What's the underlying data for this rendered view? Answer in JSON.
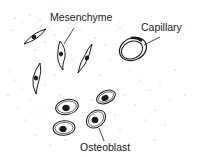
{
  "diagram": {
    "labels": {
      "mesenchyme": "Mesenchyme",
      "capillary": "Capillary",
      "osteoblast": "Osteoblast"
    },
    "colors": {
      "ink": "#1a1a1a",
      "stipple": "#9a9a9a",
      "background": "#ffffff"
    }
  }
}
